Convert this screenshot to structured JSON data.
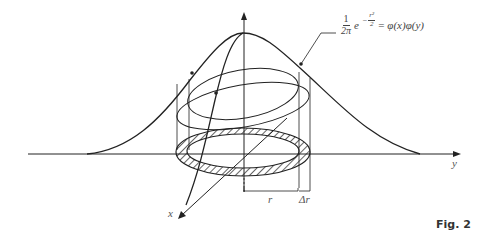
{
  "figure": {
    "caption": "Fig. 2",
    "formula": {
      "coef_num": "1",
      "coef_den": "2π",
      "base": "e",
      "exp_sign": "−",
      "exp_num": "r²",
      "exp_den": "2",
      "equals": "=",
      "rhs": "φ(x)φ(y)"
    },
    "axis_labels": {
      "x": "x",
      "y": "y"
    },
    "dimension_labels": {
      "radius": "r",
      "delta_radius": "Δr"
    },
    "colors": {
      "line": "#222222",
      "label": "#555555",
      "background": "#ffffff"
    }
  }
}
